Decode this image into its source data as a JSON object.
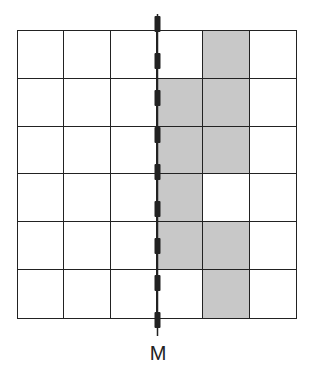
{
  "diagram": {
    "type": "grid-reflection",
    "rows": 6,
    "cols": 6,
    "shaded_color": "#c8c8c8",
    "line_color": "#222222",
    "shaded_cells": [
      [
        0,
        4
      ],
      [
        1,
        3
      ],
      [
        1,
        4
      ],
      [
        2,
        3
      ],
      [
        2,
        4
      ],
      [
        3,
        3
      ],
      [
        4,
        3
      ],
      [
        4,
        4
      ],
      [
        5,
        4
      ]
    ],
    "axis": {
      "label": "M",
      "style": "dashed",
      "position": "between column 3 and column 4 (vertical line of symmetry)"
    }
  }
}
